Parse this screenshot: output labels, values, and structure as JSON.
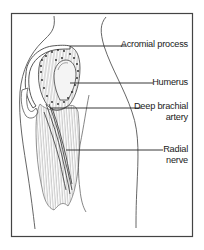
{
  "figure": {
    "frame_color": "#444444",
    "line_color": "#333333",
    "dot_color": "#222222",
    "labels": [
      {
        "id": "acromial-process",
        "lines": [
          "Acromial process"
        ]
      },
      {
        "id": "humerus",
        "lines": [
          "Humerus"
        ]
      },
      {
        "id": "deep-brachial-artery",
        "lines": [
          "Deep brachial",
          "artery"
        ]
      },
      {
        "id": "radial-nerve",
        "lines": [
          "Radial",
          "nerve"
        ]
      }
    ]
  }
}
